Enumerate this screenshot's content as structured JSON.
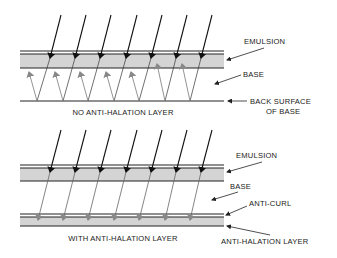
{
  "top_panel": {
    "caption": "NO ANTI-HALATION LAYER",
    "labels": {
      "emulsion": "EMULSION",
      "base": "BASE",
      "back_surface_line1": "BACK SURFACE",
      "back_surface_line2": "OF BASE"
    }
  },
  "bottom_panel": {
    "caption": "WITH ANTI-HALATION LAYER",
    "labels": {
      "emulsion": "EMULSION",
      "base": "BASE",
      "anti_curl": "ANTI-CURL",
      "anti_halation": "ANTI-HALATION LAYER"
    }
  },
  "colors": {
    "line": "#222222",
    "layer_fill": "#d4d4d4",
    "reflected_ray": "#888888"
  }
}
